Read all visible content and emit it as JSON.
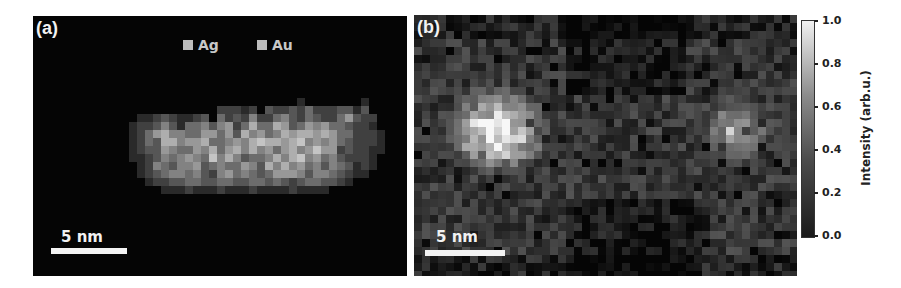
{
  "chart_data": [
    {
      "type": "heatmap",
      "panel_label": "(a)",
      "title": "",
      "legend": [
        {
          "label": "Ag",
          "swatch_color": "#bdbdbd"
        },
        {
          "label": "Au",
          "swatch_color": "#bdbdbd"
        }
      ],
      "scalebar": {
        "label": "5 nm",
        "length_px": 76
      },
      "description": "Elemental map of a Ag/Au nanorod; elongated gray particle centered horizontally on black background",
      "cell_px": 8,
      "origin": [
        88,
        74
      ],
      "levels_scale": "0-9 maps to gray 0..0.85",
      "rows": [
        "000000000000000000000000000000000",
        "000000000000000000000010000000100",
        "000000000000222120322324222331300",
        "0011232112304232522453243224632200",
        "012235314453562474476346564432210",
        "0124675544664637564576776764422210",
        "0124377566744565787767856564322210",
        "0123365446574675756467568662322110",
        "0112354565485753445757856453222100",
        "0012543556345446537575645354312100",
        "001234554532564543466653554321100",
        "000122334433443344343234433210000",
        "000001112111211121111211110000000"
      ]
    },
    {
      "type": "heatmap",
      "panel_label": "(b)",
      "title": "",
      "scalebar": {
        "label": "5 nm",
        "length_px": 80
      },
      "description": "Intensity map showing two particles: bright cluster at left, dimmer cluster at right",
      "colorbar": {
        "label": "Intensity (arb.u.)",
        "ticks": [
          "1.0",
          "0.8",
          "0.6",
          "0.4",
          "0.2",
          "0.0"
        ],
        "range": [
          0.0,
          1.0
        ]
      }
    }
  ],
  "panel_a": {
    "label": "(a)",
    "legend_ag": "Ag",
    "legend_au": "Au",
    "scalebar_label": "5 nm"
  },
  "panel_b": {
    "label": "(b)",
    "scalebar_label": "5 nm"
  },
  "colorbar": {
    "title": "Intensity (arb.u.)",
    "ticks": [
      "1.0",
      "0.8",
      "0.6",
      "0.4",
      "0.2",
      "0.0"
    ]
  }
}
